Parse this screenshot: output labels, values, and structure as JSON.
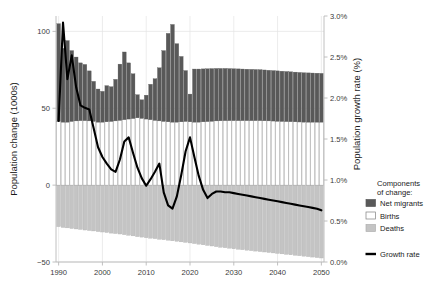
{
  "chart_data": {
    "type": "bar",
    "title": "",
    "subtitle": "",
    "xlabel": "",
    "ylabel": "Population change (1000s)",
    "y2label": "Population growth rate (%)",
    "xlim": [
      1989.4,
      2050.6
    ],
    "ylim": [
      -50,
      110
    ],
    "y2lim": [
      0.0,
      3.0
    ],
    "grid": true,
    "legend_position": "right",
    "x_ticks": [
      1990,
      2000,
      2010,
      2020,
      2030,
      2040,
      2050
    ],
    "x_tick_labels": [
      "1990",
      "2000",
      "2010",
      "2020",
      "2030",
      "2040",
      "2050"
    ],
    "y_ticks": [
      -50,
      0,
      50,
      100
    ],
    "y_tick_labels": [
      "−50",
      "0",
      "50",
      "100"
    ],
    "y2_ticks": [
      0.0,
      0.5,
      1.0,
      1.5,
      2.0,
      2.5,
      3.0
    ],
    "y2_tick_labels": [
      "0.0%",
      "0.5%",
      "1.0%",
      "1.5%",
      "2.0%",
      "2.5%",
      "3.0%"
    ],
    "colors": {
      "net_migrants": "#595959",
      "births": "#ffffff",
      "births_edge": "#9a9a9a",
      "deaths": "#c4c4c4",
      "deaths_edge": "#b0b0b0",
      "growth_rate": "#000000",
      "axis": "#b9b9b9",
      "grid": "#e4e4e4",
      "text": "#1a1a1a",
      "background": "#ffffff"
    },
    "x": [
      1990,
      1991,
      1992,
      1993,
      1994,
      1995,
      1996,
      1997,
      1998,
      1999,
      2000,
      2001,
      2002,
      2003,
      2004,
      2005,
      2006,
      2007,
      2008,
      2009,
      2010,
      2011,
      2012,
      2013,
      2014,
      2015,
      2016,
      2017,
      2018,
      2019,
      2020,
      2021,
      2022,
      2023,
      2024,
      2025,
      2026,
      2027,
      2028,
      2029,
      2030,
      2031,
      2032,
      2033,
      2034,
      2035,
      2036,
      2037,
      2038,
      2039,
      2040,
      2041,
      2042,
      2043,
      2044,
      2045,
      2046,
      2047,
      2048,
      2049,
      2050
    ],
    "series": [
      {
        "name": "Births",
        "stack": "positive",
        "values": [
          41.5,
          41.0,
          41.0,
          41.5,
          41.8,
          42.0,
          42.0,
          41.8,
          41.5,
          41.0,
          41.0,
          41.2,
          41.5,
          41.8,
          42.2,
          42.6,
          43.0,
          43.4,
          43.8,
          43.5,
          43.0,
          42.6,
          42.2,
          41.8,
          41.5,
          41.2,
          41.0,
          41.0,
          41.2,
          41.5,
          41.2,
          41.0,
          41.0,
          41.2,
          41.4,
          41.6,
          41.8,
          41.9,
          42.0,
          42.0,
          42.0,
          42.0,
          42.0,
          42.0,
          42.0,
          42.0,
          42.0,
          41.9,
          41.8,
          41.7,
          41.6,
          41.5,
          41.4,
          41.3,
          41.2,
          41.1,
          41.0,
          41.0,
          41.0,
          41.0,
          41.0
        ]
      },
      {
        "name": "Net migrants",
        "stack": "positive",
        "values": [
          63.5,
          48.0,
          53.0,
          46.0,
          41.5,
          37.5,
          36.5,
          32.5,
          26.0,
          21.5,
          20.0,
          23.5,
          22.5,
          27.0,
          36.5,
          44.0,
          36.5,
          29.0,
          15.0,
          12.0,
          15.5,
          23.0,
          27.0,
          34.5,
          46.0,
          57.5,
          63.5,
          51.0,
          42.5,
          33.0,
          18.0,
          34.5,
          34.5,
          34.4,
          34.3,
          34.2,
          34.1,
          34.0,
          33.9,
          33.8,
          33.7,
          33.6,
          33.5,
          33.4,
          33.3,
          33.2,
          33.1,
          33.0,
          32.9,
          32.8,
          32.7,
          32.6,
          32.5,
          32.4,
          32.3,
          32.2,
          32.1,
          32.0,
          31.9,
          31.8,
          31.7
        ]
      },
      {
        "name": "Deaths",
        "stack": "negative",
        "values": [
          -27.0,
          -27.5,
          -27.8,
          -28.2,
          -28.5,
          -28.8,
          -29.2,
          -29.5,
          -29.8,
          -30.2,
          -30.5,
          -30.8,
          -31.2,
          -31.5,
          -31.8,
          -32.2,
          -32.6,
          -33.0,
          -33.5,
          -33.8,
          -34.2,
          -34.5,
          -34.8,
          -35.2,
          -35.5,
          -35.8,
          -36.2,
          -36.5,
          -36.9,
          -37.2,
          -37.6,
          -38.0,
          -38.4,
          -38.8,
          -39.2,
          -39.6,
          -40.0,
          -40.4,
          -40.7,
          -41.0,
          -41.4,
          -41.7,
          -42.0,
          -42.3,
          -42.6,
          -42.9,
          -43.2,
          -43.5,
          -43.8,
          -44.1,
          -44.4,
          -44.7,
          -45.0,
          -45.3,
          -45.6,
          -45.9,
          -46.2,
          -46.5,
          -46.8,
          -47.1,
          -47.4
        ]
      }
    ],
    "line_series": {
      "name": "Growth rate",
      "unit": "%",
      "axis": "right",
      "values": [
        1.72,
        2.92,
        2.23,
        2.52,
        2.13,
        1.91,
        1.88,
        1.86,
        1.63,
        1.4,
        1.28,
        1.2,
        1.13,
        1.1,
        1.25,
        1.47,
        1.52,
        1.33,
        1.15,
        1.02,
        0.93,
        1.01,
        1.1,
        1.2,
        0.85,
        0.69,
        0.65,
        0.8,
        1.06,
        1.35,
        1.52,
        1.28,
        1.05,
        0.88,
        0.78,
        0.83,
        0.86,
        0.86,
        0.85,
        0.85,
        0.84,
        0.83,
        0.82,
        0.81,
        0.8,
        0.79,
        0.78,
        0.77,
        0.76,
        0.75,
        0.74,
        0.73,
        0.72,
        0.71,
        0.7,
        0.69,
        0.68,
        0.67,
        0.66,
        0.65,
        0.63
      ]
    }
  },
  "legend": {
    "title_line1": "Components",
    "title_line2": "of change:",
    "items": [
      {
        "label": "Net migrants",
        "swatch": "filled-dark",
        "color": "#595959"
      },
      {
        "label": "Births",
        "swatch": "outline-white",
        "color": "#ffffff"
      },
      {
        "label": "Deaths",
        "swatch": "filled-light",
        "color": "#c4c4c4"
      }
    ],
    "line_item": {
      "label": "Growth rate",
      "swatch": "line",
      "color": "#000000"
    }
  }
}
